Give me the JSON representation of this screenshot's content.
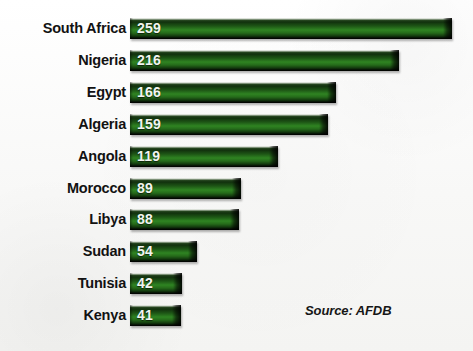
{
  "chart_data": {
    "type": "bar",
    "orientation": "horizontal",
    "title": "",
    "subtitle": "",
    "xlabel": "",
    "ylabel": "",
    "grid": false,
    "legend": null,
    "xlim": [
      0,
      259
    ],
    "categories": [
      "South Africa",
      "Nigeria",
      "Egypt",
      "Algeria",
      "Angola",
      "Morocco",
      "Libya",
      "Sudan",
      "Tunisia",
      "Kenya"
    ],
    "values": [
      259,
      216,
      166,
      159,
      119,
      89,
      88,
      54,
      42,
      41
    ],
    "bars": [
      {
        "category": "South Africa",
        "value": 259,
        "value_label": "259"
      },
      {
        "category": "Nigeria",
        "value": 216,
        "value_label": "216"
      },
      {
        "category": "Egypt",
        "value": 166,
        "value_label": "166"
      },
      {
        "category": "Algeria",
        "value": 159,
        "value_label": "159"
      },
      {
        "category": "Angola",
        "value": 119,
        "value_label": "119"
      },
      {
        "category": "Morocco",
        "value": 89,
        "value_label": "89"
      },
      {
        "category": "Libya",
        "value": 88,
        "value_label": "88"
      },
      {
        "category": "Sudan",
        "value": 54,
        "value_label": "54"
      },
      {
        "category": "Tunisia",
        "value": 42,
        "value_label": "42"
      },
      {
        "category": "Kenya",
        "value": 41,
        "value_label": "41"
      }
    ],
    "annotations": [
      {
        "name": "source",
        "text": "Source: AFDB"
      }
    ]
  },
  "source_note": "Source: AFDB",
  "colors": {
    "background": "#fbfbfa",
    "bar_highlight": "#2f8422",
    "bar_dark": "#0b2408",
    "label_text": "#121212",
    "value_text": "#f2f4f0"
  }
}
